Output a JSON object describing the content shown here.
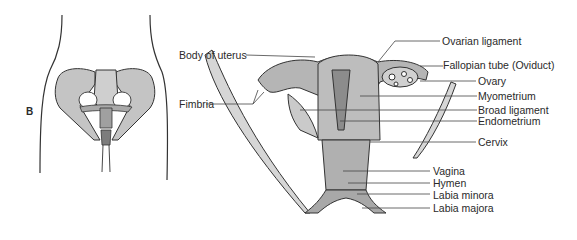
{
  "figure": {
    "panel_label": "B",
    "colors": {
      "tissue_fill": "#b8b8b8",
      "tissue_dark": "#8e8e8e",
      "outline": "#3a3a3a",
      "leader_line": "#444444",
      "text": "#2a2a2a"
    },
    "labels": {
      "body_of_uterus": "Body of uterus",
      "fimbria": "Fimbria",
      "ovarian_ligament": "Ovarian ligament",
      "fallopian_tube": "Fallopian tube (Oviduct)",
      "ovary": "Ovary",
      "myometrium": "Myometrium",
      "broad_ligament": "Broad ligament",
      "endometrium": "Endometrium",
      "cervix": "Cervix",
      "vagina": "Vagina",
      "hymen": "Hymen",
      "labia_minora": "Labia minora",
      "labia_majora": "Labia majora"
    }
  }
}
